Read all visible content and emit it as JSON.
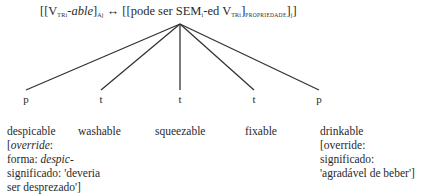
{
  "schema": {
    "left": {
      "open": "[[V",
      "sub1": "TRi",
      "affix": "-able",
      "close": "]",
      "sub2": "Aj"
    },
    "arrow": "↔",
    "right": {
      "open": "[[pode ser SEM",
      "sub1": "i",
      "mid": "-ed V",
      "sub2": "TRi",
      "close1": "]",
      "sub3": "PROPRIEDADE",
      "close2": "]",
      "sub4": "j",
      "close3": "]"
    }
  },
  "nodes": [
    {
      "label": "p",
      "x": 26
    },
    {
      "label": "t",
      "x": 101
    },
    {
      "label": "t",
      "x": 180
    },
    {
      "label": "t",
      "x": 254
    },
    {
      "label": "p",
      "x": 319
    }
  ],
  "leaves": [
    {
      "word": "despicable",
      "lines": [
        "[",
        "override",
        ":",
        "forma: ",
        "despic-",
        "significado: 'deveria",
        "ser desprezado']"
      ]
    },
    {
      "word": "washable"
    },
    {
      "word": "squeezable"
    },
    {
      "word": "fixable"
    },
    {
      "word": "drinkable",
      "lines": [
        "[override:",
        "significado:",
        "'agradável de beber']"
      ]
    }
  ]
}
